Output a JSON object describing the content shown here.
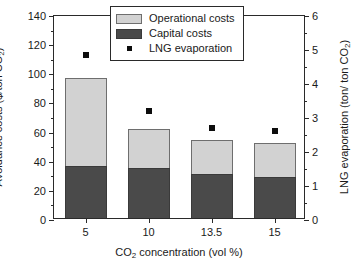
{
  "chart_data": {
    "type": "bar",
    "title": "",
    "categories": [
      "5",
      "10",
      "13.5",
      "15"
    ],
    "xlabel": "CO2 concentration (vol %)",
    "ylabel": "Avoidance costs ($/ton CO2)",
    "ylabel_right": "LNG evaporation (ton/ ton CO2)",
    "ylim": [
      0,
      140
    ],
    "ylim_right": [
      0,
      6
    ],
    "yticks": [
      0,
      20,
      40,
      60,
      80,
      100,
      120,
      140
    ],
    "yticks_right": [
      0,
      1,
      2,
      3,
      4,
      5,
      6
    ],
    "grid": false,
    "stacked": true,
    "legend_position": "top-right",
    "series": [
      {
        "name": "Capital costs",
        "axis": "left",
        "type": "bar",
        "color": "#4a4a4a",
        "values": [
          36,
          34.5,
          30,
          28
        ]
      },
      {
        "name": "Operational costs",
        "axis": "left",
        "type": "bar",
        "color": "#d2d2d2",
        "values": [
          60,
          26.5,
          23.5,
          23.5
        ]
      },
      {
        "name": "LNG evaporation",
        "axis": "right",
        "type": "scatter",
        "color": "#0d0d0d",
        "values": [
          4.8,
          3.15,
          2.65,
          2.55
        ]
      }
    ],
    "totals": [
      96,
      61,
      53.5,
      51.5
    ]
  },
  "axis_labels": {
    "x_title_main": "CO",
    "x_title_sub": "2",
    "x_title_rest": " concentration (vol %)",
    "y_left_main": "Avoidance costs ($/ton CO",
    "y_left_sub": "2",
    "y_left_rest": ")",
    "y_right_main": "LNG evaporation (ton/ ton CO",
    "y_right_sub": "2",
    "y_right_rest": ")"
  },
  "legend": {
    "items": [
      {
        "label": "Operational costs",
        "marker": "square-swatch-light"
      },
      {
        "label": "Capital costs",
        "marker": "square-swatch-dark"
      },
      {
        "label": "LNG evaporation",
        "marker": "square-point-black"
      }
    ]
  },
  "ticks": {
    "left": [
      "140",
      "120",
      "100",
      "80",
      "60",
      "40",
      "20",
      "0"
    ],
    "right": [
      "6",
      "5",
      "4",
      "3",
      "2",
      "1",
      "0"
    ],
    "bottom": [
      "5",
      "10",
      "13.5",
      "15"
    ]
  }
}
